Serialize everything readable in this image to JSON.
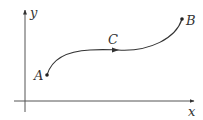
{
  "diagram": {
    "axes": {
      "x_label": "x",
      "y_label": "y"
    },
    "points": [
      {
        "id": "A",
        "label": "A"
      },
      {
        "id": "B",
        "label": "B"
      }
    ],
    "curve": {
      "label": "C",
      "direction": "A to B"
    },
    "colors": {
      "stroke": "#333333",
      "axis": "#555555"
    }
  }
}
